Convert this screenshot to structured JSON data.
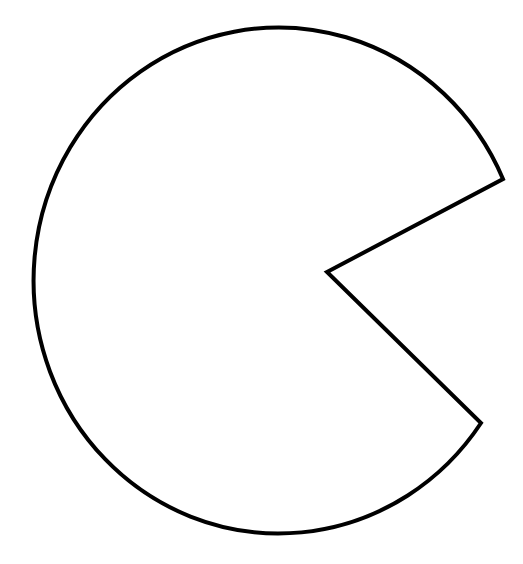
{
  "figure": {
    "shape": "pac-man-shape",
    "background": "#ffffff",
    "stroke_color": "#000000",
    "fill_color": "#ffffff",
    "stroke_width": 4,
    "ellipse": {
      "cx": 282,
      "cy": 279,
      "rx": 245,
      "ry": 253
    },
    "wedge": {
      "top_point": [
        503,
        179
      ],
      "inner_vertex": [
        327,
        272
      ],
      "bottom_point": [
        481,
        423
      ]
    }
  }
}
